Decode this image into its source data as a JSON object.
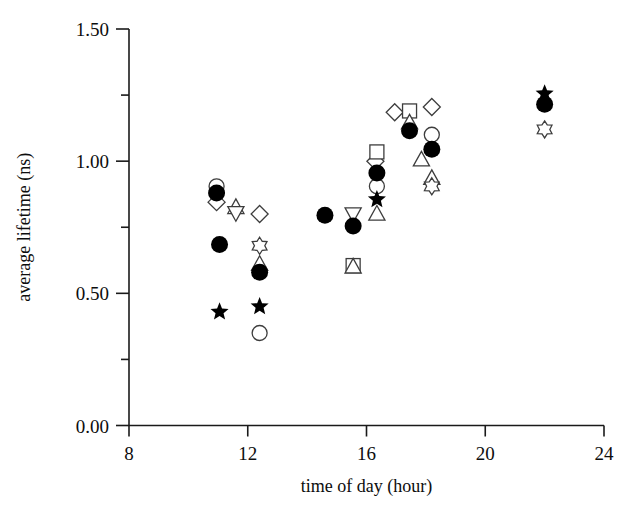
{
  "figure": {
    "background_color": "#ffffff",
    "ink_color": "#000000"
  },
  "axes": {
    "x": {
      "title": "time of day (hour)",
      "ticks": [
        "8",
        "12",
        "16",
        "20",
        "24"
      ],
      "range": [
        8,
        24
      ],
      "minor_ticks": false
    },
    "y": {
      "title": "average lifetime (ns)",
      "ticks": [
        "0.00",
        "0.50",
        "1.00",
        "1.50"
      ],
      "range": [
        0.0,
        1.5
      ],
      "minor_tick_values": [
        0.25,
        0.75,
        1.25
      ]
    }
  },
  "chart_data": {
    "type": "scatter",
    "title": "",
    "xlabel": "time of day (hour)",
    "ylabel": "average lifetime (ns)",
    "xlim": [
      8,
      24
    ],
    "ylim": [
      0.0,
      1.5
    ],
    "xticks": [
      8,
      12,
      16,
      20,
      24
    ],
    "yticks": [
      0.0,
      0.5,
      1.0,
      1.5
    ],
    "yticks_minor": [
      0.25,
      0.75,
      1.25
    ],
    "grid": false,
    "legend": "none",
    "marker_color_filled": "#000000",
    "marker_color_open": "#ffffff",
    "marker_edge_color": "#3d3d3d",
    "points": [
      {
        "x": 10.95,
        "y": 0.905,
        "marker": "circle-open"
      },
      {
        "x": 10.95,
        "y": 0.88,
        "marker": "circle-filled"
      },
      {
        "x": 10.95,
        "y": 0.845,
        "marker": "diamond-open"
      },
      {
        "x": 11.6,
        "y": 0.825,
        "marker": "triangle-up-open"
      },
      {
        "x": 11.6,
        "y": 0.805,
        "marker": "triangle-down-open"
      },
      {
        "x": 11.05,
        "y": 0.685,
        "marker": "circle-filled"
      },
      {
        "x": 11.05,
        "y": 0.43,
        "marker": "star-filled"
      },
      {
        "x": 12.4,
        "y": 0.8,
        "marker": "diamond-open"
      },
      {
        "x": 12.4,
        "y": 0.68,
        "marker": "star-open"
      },
      {
        "x": 12.4,
        "y": 0.61,
        "marker": "triangle-up-open"
      },
      {
        "x": 12.4,
        "y": 0.58,
        "marker": "circle-filled"
      },
      {
        "x": 12.4,
        "y": 0.45,
        "marker": "star-filled"
      },
      {
        "x": 12.4,
        "y": 0.35,
        "marker": "circle-open"
      },
      {
        "x": 14.6,
        "y": 0.795,
        "marker": "circle-filled"
      },
      {
        "x": 15.55,
        "y": 0.8,
        "marker": "triangle-down-open"
      },
      {
        "x": 15.55,
        "y": 0.755,
        "marker": "circle-filled"
      },
      {
        "x": 15.55,
        "y": 0.605,
        "marker": "square-open"
      },
      {
        "x": 15.55,
        "y": 0.6,
        "marker": "triangle-up-open"
      },
      {
        "x": 16.3,
        "y": 1.0,
        "marker": "diamond-open"
      },
      {
        "x": 16.35,
        "y": 1.035,
        "marker": "square-open"
      },
      {
        "x": 16.35,
        "y": 0.955,
        "marker": "circle-filled"
      },
      {
        "x": 16.35,
        "y": 0.905,
        "marker": "circle-open"
      },
      {
        "x": 16.35,
        "y": 0.855,
        "marker": "star-filled"
      },
      {
        "x": 16.35,
        "y": 0.8,
        "marker": "triangle-up-open"
      },
      {
        "x": 16.95,
        "y": 1.185,
        "marker": "diamond-open"
      },
      {
        "x": 17.45,
        "y": 1.19,
        "marker": "square-open"
      },
      {
        "x": 17.45,
        "y": 1.145,
        "marker": "triangle-up-open"
      },
      {
        "x": 17.45,
        "y": 1.115,
        "marker": "circle-filled"
      },
      {
        "x": 17.85,
        "y": 1.005,
        "marker": "triangle-up-open"
      },
      {
        "x": 18.2,
        "y": 1.205,
        "marker": "diamond-open"
      },
      {
        "x": 18.2,
        "y": 1.1,
        "marker": "circle-open"
      },
      {
        "x": 18.2,
        "y": 1.045,
        "marker": "circle-filled"
      },
      {
        "x": 18.2,
        "y": 0.935,
        "marker": "triangle-up-open"
      },
      {
        "x": 18.2,
        "y": 0.905,
        "marker": "star-open"
      },
      {
        "x": 22.0,
        "y": 1.255,
        "marker": "star-filled"
      },
      {
        "x": 22.0,
        "y": 1.215,
        "marker": "circle-filled"
      },
      {
        "x": 22.0,
        "y": 1.12,
        "marker": "star-open"
      }
    ]
  }
}
